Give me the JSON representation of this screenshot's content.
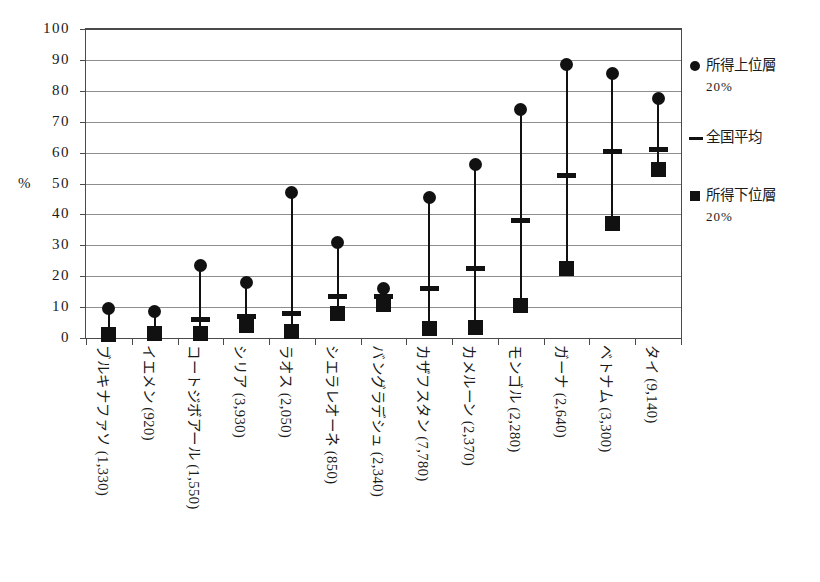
{
  "chart_data": {
    "type": "scatter",
    "title": "",
    "xlabel": "",
    "ylabel": "%",
    "ylim": [
      0,
      100
    ],
    "ytick_step": 10,
    "yticks": [
      "100",
      "90",
      "80",
      "70",
      "60",
      "50",
      "40",
      "30",
      "20",
      "10",
      "0"
    ],
    "grid": true,
    "legend_position": "right",
    "categories": [
      "ブルキナファソ (1,330)",
      "イエメン (920)",
      "コートジボアール (1,550)",
      "シリア (3,930)",
      "ラオス (2,050)",
      "シエラレオーネ (850)",
      "バングラデシュ (2,340)",
      "カザフスタン (7,780)",
      "カメルーン (2,370)",
      "モンゴル (2,280)",
      "ガーナ (2,640)",
      "ベトナム (3,300)",
      "タイ (9,140)"
    ],
    "series": [
      {
        "name": "所得上位層20%",
        "marker": "circle",
        "values": [
          9.5,
          8.7,
          23.5,
          17.8,
          47.0,
          31.0,
          16.0,
          45.5,
          56.0,
          74.0,
          88.5,
          85.5,
          77.5
        ]
      },
      {
        "name": "全国平均",
        "marker": "dash",
        "values": [
          null,
          null,
          6.0,
          7.0,
          8.0,
          13.5,
          13.5,
          16.0,
          22.5,
          38.0,
          52.5,
          60.5,
          61.0
        ]
      },
      {
        "name": "所得下位層20%",
        "marker": "square",
        "values": [
          1.0,
          1.5,
          1.5,
          4.0,
          2.0,
          8.0,
          11.0,
          3.0,
          3.5,
          10.5,
          22.5,
          37.0,
          54.5
        ]
      }
    ]
  },
  "axis": {
    "unit_label": "%"
  },
  "legend": {
    "entries": [
      {
        "key": "circle",
        "label": "所得上位層",
        "sub": "20%"
      },
      {
        "key": "dash",
        "label": "全国平均",
        "sub": ""
      },
      {
        "key": "square",
        "label": "所得下位層",
        "sub": "20%"
      }
    ]
  }
}
